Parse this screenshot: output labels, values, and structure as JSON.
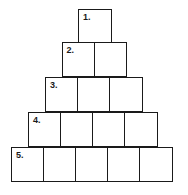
{
  "diagram": {
    "type": "number-pyramid",
    "rows": [
      {
        "label": "1.",
        "cells": 1
      },
      {
        "label": "2.",
        "cells": 2
      },
      {
        "label": "3.",
        "cells": 3
      },
      {
        "label": "4.",
        "cells": 4
      },
      {
        "label": "5.",
        "cells": 5
      }
    ],
    "border_color": "#1a1a1a",
    "background": "#ffffff"
  }
}
